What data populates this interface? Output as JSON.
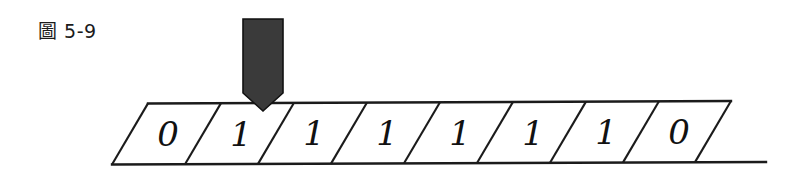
{
  "figure": {
    "caption": "圖 5-9",
    "background_color": "#ffffff",
    "line_color": "#1b1b1b",
    "digit_color": "#111111"
  },
  "head": {
    "label": "read-write-head",
    "fill_color": "#3a3a3a",
    "stroke_color": "#111111",
    "points_at_cell_index": 1
  },
  "tape": {
    "cell_count": 8,
    "cells": [
      {
        "index": 0,
        "value": "0"
      },
      {
        "index": 1,
        "value": "1"
      },
      {
        "index": 2,
        "value": "1"
      },
      {
        "index": 3,
        "value": "1"
      },
      {
        "index": 4,
        "value": "1"
      },
      {
        "index": 5,
        "value": "1"
      },
      {
        "index": 6,
        "value": "1"
      },
      {
        "index": 7,
        "value": "0"
      }
    ]
  }
}
